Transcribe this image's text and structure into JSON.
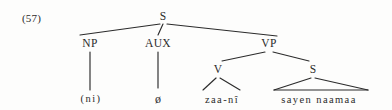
{
  "figure": {
    "example_number": "(57)",
    "kind": "syntactic-tree"
  },
  "nodes": {
    "s_root": {
      "label": "S",
      "x": 163,
      "y": 11
    },
    "np": {
      "label": "NP",
      "x": 90,
      "y": 38
    },
    "aux": {
      "label": "AUX",
      "x": 158,
      "y": 38
    },
    "vp": {
      "label": "VP",
      "x": 269,
      "y": 38
    },
    "v": {
      "label": "V",
      "x": 218,
      "y": 64
    },
    "s_embedded": {
      "label": "S",
      "x": 313,
      "y": 64
    }
  },
  "terminals": {
    "subject": {
      "label": "(ni)",
      "x": 91,
      "y": 94
    },
    "aux_null": {
      "label": "ø",
      "x": 158,
      "y": 93
    },
    "verb": {
      "label": "zaa-nî",
      "x": 222,
      "y": 95
    },
    "clause": {
      "label": "sayen naamaa",
      "x": 319,
      "y": 95
    }
  },
  "colors": {
    "ink": "#2b2b2b",
    "page": "#fdfdfc"
  },
  "edges": {
    "description": "branches of the phrase structure tree"
  }
}
